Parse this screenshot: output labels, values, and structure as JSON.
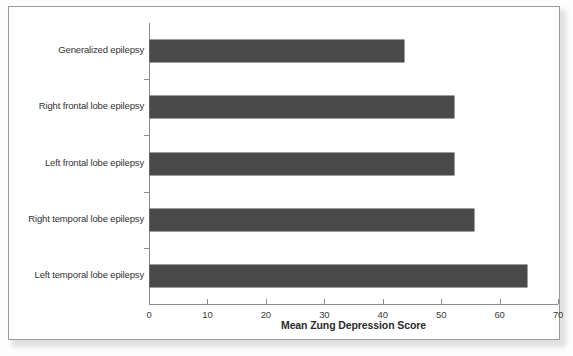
{
  "chart_data": {
    "type": "bar",
    "orientation": "horizontal",
    "title": "",
    "xlabel": "Mean Zung Depression Score",
    "ylabel": "",
    "xlim": [
      0,
      70
    ],
    "xticks": [
      0,
      10,
      20,
      30,
      40,
      50,
      60,
      70
    ],
    "xtick_labels": [
      "0",
      "10",
      "20",
      "30",
      "40",
      "50",
      "60",
      "70"
    ],
    "grid": false,
    "legend": false,
    "bar_color": "#4a4a4a",
    "categories": [
      "Generalized epilepsy",
      "Right frontal lobe epilepsy",
      "Left frontal lobe epilepsy",
      "Right temporal lobe epilepsy",
      "Left temporal lobe epilepsy"
    ],
    "values": [
      43.5,
      52,
      52,
      55.5,
      64.5
    ]
  },
  "figure": {
    "frame_border_color": "#9a9a9a",
    "axis_color": "#8e8e8e",
    "text_color": "#333333"
  }
}
